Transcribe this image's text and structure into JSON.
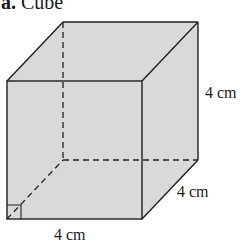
{
  "title": {
    "letter": "a.",
    "text": "Cube"
  },
  "figure": {
    "shape": "cube",
    "fill_color": "#d9d9d9",
    "edge_color": "#1f1f1f",
    "right_angle_marker": true
  },
  "labels": {
    "height": "4 cm",
    "depth": "4 cm",
    "width": "4 cm"
  }
}
